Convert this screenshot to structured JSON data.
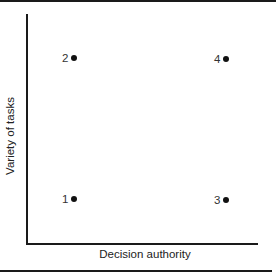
{
  "chart_data": {
    "type": "scatter",
    "title": "",
    "xlabel": "Decision authority",
    "ylabel": "Variety of tasks",
    "grid": false,
    "legend": null,
    "xlim": [
      "low",
      "high"
    ],
    "ylim": [
      "low",
      "high"
    ],
    "points": [
      {
        "label": "1",
        "x": "low",
        "y": "low"
      },
      {
        "label": "2",
        "x": "low",
        "y": "high"
      },
      {
        "label": "3",
        "x": "high",
        "y": "low"
      },
      {
        "label": "4",
        "x": "high",
        "y": "high"
      }
    ]
  },
  "axes": {
    "x_label": "Decision authority",
    "y_label": "Variety of tasks"
  },
  "points": {
    "p1": "1",
    "p2": "2",
    "p3": "3",
    "p4": "4"
  }
}
